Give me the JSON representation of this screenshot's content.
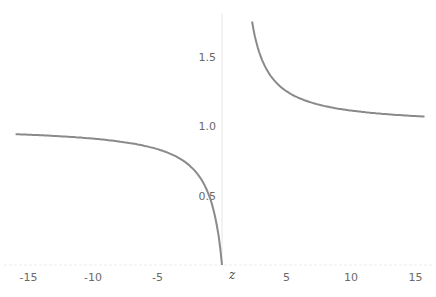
{
  "chart_data": {
    "type": "line",
    "title": "",
    "function": "z/(z-1)",
    "xlabel": "z",
    "ylabel": "",
    "xlim": [
      -16.5,
      16.5
    ],
    "ylim": [
      0,
      1.75
    ],
    "grid": false,
    "x_ticks": [
      "-15",
      "-10",
      "-5",
      "5",
      "10",
      "15"
    ],
    "y_ticks": [
      "0.5",
      "1.0",
      "1.5"
    ],
    "line_color": "#8a8a8a",
    "series": [
      {
        "name": "left branch",
        "x": [
          -16,
          -14,
          -12,
          -10,
          -8,
          -6,
          -4,
          -3,
          -2,
          -1.5,
          -1,
          -0.6,
          -0.3,
          -0.1,
          0
        ],
        "y": [
          0.941,
          0.933,
          0.923,
          0.909,
          0.889,
          0.857,
          0.8,
          0.75,
          0.667,
          0.6,
          0.5,
          0.375,
          0.231,
          0.091,
          0
        ]
      },
      {
        "name": "right branch",
        "x": [
          2.33,
          2.6,
          3,
          3.5,
          4,
          5,
          6,
          7,
          8,
          10,
          12,
          14,
          15.7
        ],
        "y": [
          1.75,
          1.625,
          1.5,
          1.4,
          1.333,
          1.25,
          1.2,
          1.167,
          1.143,
          1.111,
          1.091,
          1.077,
          1.068
        ]
      }
    ]
  }
}
